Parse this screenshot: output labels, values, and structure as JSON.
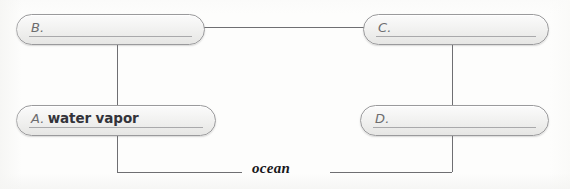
{
  "diagram": {
    "type": "water-cycle-fill-in-the-blank",
    "boxes": [
      {
        "id": "B",
        "letter": "B.",
        "answer": "",
        "position": "top-left"
      },
      {
        "id": "C",
        "letter": "C.",
        "answer": "",
        "position": "top-right"
      },
      {
        "id": "A",
        "letter": "A.",
        "answer": "water vapor",
        "position": "bottom-left"
      },
      {
        "id": "D",
        "letter": "D.",
        "answer": "",
        "position": "bottom-right"
      }
    ],
    "ocean_label": "ocean",
    "colors": {
      "box_border": "#9a9a9c",
      "box_fill": "#f2f2f1",
      "connector_line": "#6f6f72",
      "label_text": "#17171a",
      "letter_text": "#6c6c6e",
      "answer_text": "#33333a",
      "background": "#fdfdfc"
    }
  }
}
